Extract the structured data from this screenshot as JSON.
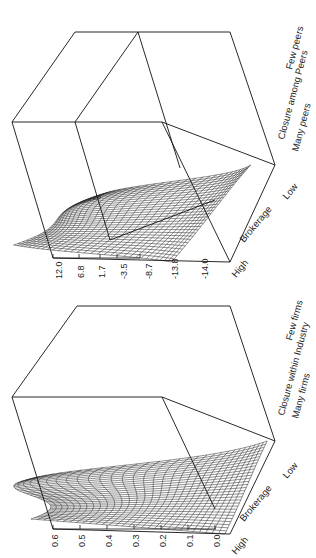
{
  "figure": {
    "orientation": "rotated-90",
    "panels": 2
  },
  "chart_data": [
    {
      "type": "surface",
      "panel": "top",
      "title": "",
      "zlabel": "",
      "z_ticks": [
        "12.0",
        "6.8",
        "1.7",
        "-3.5",
        "-8.7",
        "-13.8",
        "-14.0"
      ],
      "zlim": [
        -14.0,
        12.0
      ],
      "x_axis": {
        "label": "Brokerage",
        "low_end": "Low",
        "high_end": "High"
      },
      "y_axis": {
        "label": "Closure among Peers",
        "low_end": "Many peers",
        "high_end": "Few peers"
      },
      "grid": "wireframe mesh",
      "description": "Wireframe surface; peak at high brokerage / few peers corner, trough toward low brokerage / many peers with ridge fold"
    },
    {
      "type": "surface",
      "panel": "bottom",
      "title": "",
      "zlabel": "",
      "z_ticks": [
        "0.6",
        "0.5",
        "0.4",
        "0.3",
        "0.2",
        "0.1",
        "0.0"
      ],
      "zlim": [
        0.0,
        0.6
      ],
      "x_axis": {
        "label": "Brokerage",
        "low_end": "Low",
        "high_end": "High"
      },
      "y_axis": {
        "label": "Closure within Industry",
        "low_end": "Many firms",
        "high_end": "Few firms"
      },
      "grid": "wireframe mesh",
      "description": "Wireframe surface; peak ~0.6 at high brokerage / few firms corner, near 0.2 at high brokerage / many firms, falling toward 0.0 at low brokerage"
    }
  ],
  "labels": {
    "top": {
      "ticks": [
        "12.0",
        "6.8",
        "1.7",
        "-3.5",
        "-8.7",
        "-13.8",
        "-14.0"
      ],
      "high": "High",
      "brokerage": "Brokerage",
      "low": "Low",
      "closure": "Closure among Peers",
      "many": "Many peers",
      "few": "Few peers"
    },
    "bottom": {
      "ticks": [
        "0.6",
        "0.5",
        "0.4",
        "0.3",
        "0.2",
        "0.1",
        "0.0"
      ],
      "high": "High",
      "brokerage": "Brokerage",
      "low": "Low",
      "closure": "Closure within Industry",
      "many": "Many firms",
      "few": "Few firms"
    }
  }
}
